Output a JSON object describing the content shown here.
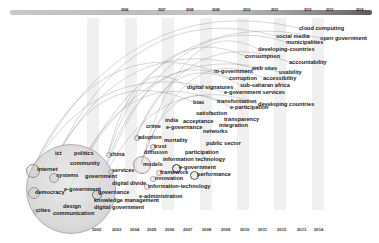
{
  "timeline": {
    "top_year_labels": [
      {
        "label": "2006",
        "x": 121
      },
      {
        "label": "2007",
        "x": 158
      },
      {
        "label": "2008",
        "x": 186
      },
      {
        "label": "2009",
        "x": 212
      },
      {
        "label": "2010",
        "x": 243
      },
      {
        "label": "2011",
        "x": 271
      },
      {
        "label": "2012",
        "x": 304
      },
      {
        "label": "2013",
        "x": 326
      },
      {
        "label": "2014",
        "x": 356
      }
    ],
    "bottom_year_labels": [
      {
        "label": "2002",
        "x": 92
      },
      {
        "label": "2003",
        "x": 112
      },
      {
        "label": "2004",
        "x": 130
      },
      {
        "label": "2005",
        "x": 147
      },
      {
        "label": "2006",
        "x": 165
      },
      {
        "label": "2007",
        "x": 183
      },
      {
        "label": "2008",
        "x": 202
      },
      {
        "label": "2009",
        "x": 221
      },
      {
        "label": "2010",
        "x": 240
      },
      {
        "label": "2011",
        "x": 258
      },
      {
        "label": "2012",
        "x": 277
      },
      {
        "label": "2013",
        "x": 297
      },
      {
        "label": "2014",
        "x": 314
      }
    ]
  },
  "keywords": [
    {
      "label": "cloud computing",
      "x": 299,
      "y": 28
    },
    {
      "label": "social media",
      "x": 276,
      "y": 36
    },
    {
      "label": "open government",
      "x": 320,
      "y": 38
    },
    {
      "label": "municipalities",
      "x": 286,
      "y": 42
    },
    {
      "label": "developing-countries",
      "x": 258,
      "y": 49
    },
    {
      "label": "consumption",
      "x": 245,
      "y": 56
    },
    {
      "label": "accountability",
      "x": 289,
      "y": 62
    },
    {
      "label": "m-government",
      "x": 214,
      "y": 71
    },
    {
      "label": "web sites",
      "x": 252,
      "y": 68
    },
    {
      "label": "usability",
      "x": 279,
      "y": 72
    },
    {
      "label": "corruption",
      "x": 229,
      "y": 78
    },
    {
      "label": "accessibility",
      "x": 263,
      "y": 78
    },
    {
      "label": "digital signatures",
      "x": 187,
      "y": 87
    },
    {
      "label": "sub-saharan africa",
      "x": 240,
      "y": 85
    },
    {
      "label": "e-government services",
      "x": 224,
      "y": 92
    },
    {
      "label": "bias",
      "x": 193,
      "y": 102
    },
    {
      "label": "transformation",
      "x": 217,
      "y": 101
    },
    {
      "label": "developing countries",
      "x": 258,
      "y": 104
    },
    {
      "label": "e-participation",
      "x": 230,
      "y": 107
    },
    {
      "label": "satisfaction",
      "x": 196,
      "y": 113
    },
    {
      "label": "transparency",
      "x": 224,
      "y": 119
    },
    {
      "label": "india",
      "x": 165,
      "y": 120
    },
    {
      "label": "acceptance",
      "x": 183,
      "y": 121
    },
    {
      "label": "integration",
      "x": 219,
      "y": 125
    },
    {
      "label": "e-governance",
      "x": 166,
      "y": 127
    },
    {
      "label": "crime",
      "x": 146,
      "y": 126
    },
    {
      "label": "networks",
      "x": 203,
      "y": 131
    },
    {
      "label": "adoption",
      "x": 138,
      "y": 137
    },
    {
      "label": "mortality",
      "x": 164,
      "y": 140
    },
    {
      "label": "public sector",
      "x": 206,
      "y": 143
    },
    {
      "label": "trust",
      "x": 154,
      "y": 146
    },
    {
      "label": "diffusion",
      "x": 144,
      "y": 152
    },
    {
      "label": "participation",
      "x": 185,
      "y": 152
    },
    {
      "label": "information technology",
      "x": 163,
      "y": 159
    },
    {
      "label": "models",
      "x": 143,
      "y": 164
    },
    {
      "label": "e-government",
      "x": 179,
      "y": 167
    },
    {
      "label": "framework",
      "x": 160,
      "y": 172
    },
    {
      "label": "performance",
      "x": 197,
      "y": 174
    },
    {
      "label": "innovation",
      "x": 155,
      "y": 178
    },
    {
      "label": "information-technology",
      "x": 148,
      "y": 186
    },
    {
      "label": "e-administration",
      "x": 139,
      "y": 196
    },
    {
      "label": "ict",
      "x": 55,
      "y": 153
    },
    {
      "label": "politics",
      "x": 74,
      "y": 153
    },
    {
      "label": "china",
      "x": 110,
      "y": 154
    },
    {
      "label": "internet",
      "x": 37,
      "y": 169
    },
    {
      "label": "community",
      "x": 70,
      "y": 163
    },
    {
      "label": "services",
      "x": 112,
      "y": 170
    },
    {
      "label": "systems",
      "x": 56,
      "y": 175
    },
    {
      "label": "government",
      "x": 85,
      "y": 176
    },
    {
      "label": "digital divide",
      "x": 112,
      "y": 183
    },
    {
      "label": "democracy",
      "x": 35,
      "y": 192
    },
    {
      "label": "e-government",
      "x": 64,
      "y": 189
    },
    {
      "label": "governance",
      "x": 98,
      "y": 192
    },
    {
      "label": "knowledge management",
      "x": 94,
      "y": 200
    },
    {
      "label": "digital government",
      "x": 94,
      "y": 207
    },
    {
      "label": "cities",
      "x": 36,
      "y": 210
    },
    {
      "label": "design",
      "x": 63,
      "y": 206
    },
    {
      "label": "communication",
      "x": 53,
      "y": 213
    }
  ],
  "nodes": [
    {
      "name": "e-government-main",
      "x": 70,
      "y": 188,
      "r": 44,
      "color": "#bdbdbd"
    },
    {
      "name": "internet",
      "x": 32,
      "y": 170,
      "r": 6,
      "color": "#8c8c8c"
    },
    {
      "name": "democracy",
      "x": 33,
      "y": 192,
      "r": 5,
      "color": "#9a9a9a"
    },
    {
      "name": "systems",
      "x": 53,
      "y": 177,
      "r": 4,
      "color": "#9a9a9a"
    },
    {
      "name": "governance",
      "x": 96,
      "y": 194,
      "r": 4,
      "color": "#777777"
    },
    {
      "name": "models",
      "x": 141,
      "y": 164,
      "r": 8,
      "color": "#b88f8f"
    },
    {
      "name": "e-government-2",
      "x": 175,
      "y": 167,
      "r": 3.5,
      "color": "#333333"
    },
    {
      "name": "performance",
      "x": 193,
      "y": 174,
      "r": 3.5,
      "color": "#555555"
    },
    {
      "name": "china",
      "x": 108,
      "y": 154,
      "r": 2,
      "color": "#aaaaaa"
    },
    {
      "name": "services",
      "x": 110,
      "y": 171,
      "r": 2,
      "color": "#aaaaaa"
    },
    {
      "name": "adoption",
      "x": 136,
      "y": 137,
      "r": 2,
      "color": "#999999"
    },
    {
      "name": "trust",
      "x": 152,
      "y": 146,
      "r": 2,
      "color": "#999999"
    },
    {
      "name": "framework",
      "x": 158,
      "y": 172,
      "r": 1.8,
      "color": "#aaaaaa"
    },
    {
      "name": "innovation",
      "x": 152,
      "y": 178,
      "r": 1.8,
      "color": "#aaaaaa"
    },
    {
      "name": "information-technology",
      "x": 146,
      "y": 186,
      "r": 1.8,
      "color": "#aaaaaa"
    },
    {
      "name": "cities",
      "x": 34,
      "y": 210,
      "r": 1.5,
      "color": "#aaaaaa"
    }
  ],
  "bands": [
    {
      "x": 87,
      "w": 12
    },
    {
      "x": 125,
      "w": 12
    },
    {
      "x": 162,
      "w": 12
    },
    {
      "x": 200,
      "w": 12
    },
    {
      "x": 237,
      "w": 12
    },
    {
      "x": 274,
      "w": 12
    },
    {
      "x": 312,
      "w": 12
    }
  ]
}
